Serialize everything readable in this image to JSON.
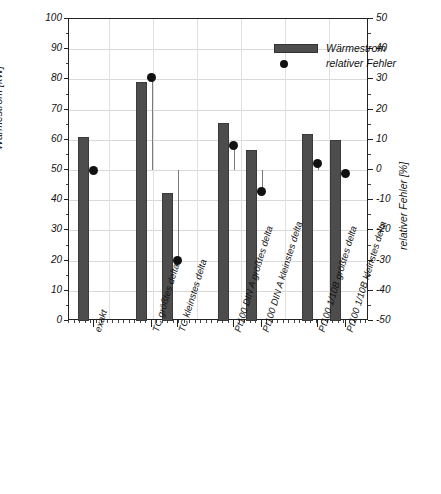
{
  "chart_data": {
    "type": "bar",
    "title": "",
    "categories": [
      "exakt",
      "TC größtes delta",
      "TC kleinstes delta",
      "Pt100 DIN A größtes delta",
      "Pt100 DIN A kleinstes delta",
      "Pt100 1/10B größtes delta",
      "Pt100 1/10B kleinstes delta"
    ],
    "series": [
      {
        "name": "Wärmestrom",
        "type": "bar",
        "axis": "left",
        "unit": "kW",
        "values": [
          61,
          79,
          42.5,
          65.5,
          56.5,
          62,
          60
        ]
      },
      {
        "name": "relativer Fehler",
        "type": "scatter",
        "axis": "right",
        "unit": "%",
        "values": [
          0,
          30.5,
          -30,
          8,
          -7,
          2,
          -1
        ]
      }
    ],
    "xlabel": "",
    "ylabel": "Wärmestrom [kW]",
    "ylabel_right": "relativer Fehler [%]",
    "ylim": [
      0,
      100
    ],
    "ylim_right": [
      -50,
      50
    ],
    "yticks": [
      0,
      10,
      20,
      30,
      40,
      50,
      60,
      70,
      80,
      90,
      100
    ],
    "yticks_right": [
      -50,
      -40,
      -30,
      -20,
      -10,
      0,
      10,
      20,
      30,
      40,
      50
    ],
    "grid": true,
    "legend_position": "top-center",
    "legend": [
      {
        "label": "Wärmestrom",
        "marker": "bar-swatch",
        "color": "#4d4d4d"
      },
      {
        "label": "relativer Fehler",
        "marker": "filled-circle",
        "color": "#111111"
      }
    ]
  },
  "colors": {
    "bar": "#4d4d4d",
    "dot": "#111111",
    "grid": "#d9d9d9",
    "axis": "#222222",
    "background": "#ffffff"
  }
}
